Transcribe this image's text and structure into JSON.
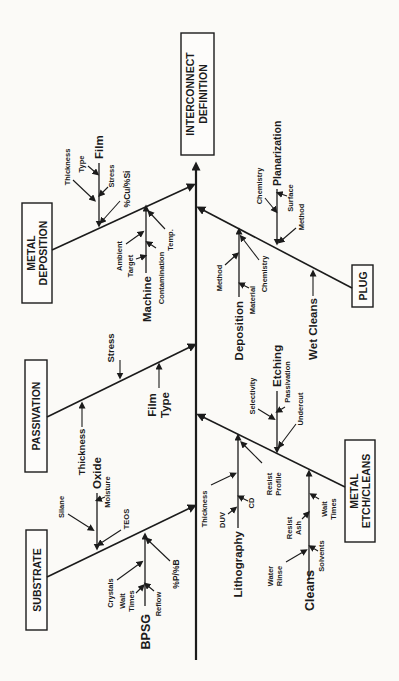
{
  "head": {
    "line1": "INTERCONNECT",
    "line2": "DEFINITION"
  },
  "bones": {
    "metal_deposition": {
      "box_line1": "METAL",
      "box_line2": "DEPOSITION",
      "film": "Film",
      "thickness": "Thickness",
      "type": "Type",
      "stress": "Stress",
      "cu_si": "%Cu/%Si",
      "machine": "Machine",
      "ambient": "Ambient",
      "target": "Target",
      "contamination": "Contamination",
      "temp": "Temp."
    },
    "passivation": {
      "box": "PASSIVATION",
      "thickness": "Thickness",
      "stress": "Stress",
      "film_type_line1": "Film",
      "film_type_line2": "Type"
    },
    "substrate": {
      "box": "SUBSTRATE",
      "oxide": "Oxide",
      "silane": "Silane",
      "moisture": "Moisture",
      "teos": "TEOS",
      "bpsg": "BPSG",
      "crystals": "Crystals",
      "wait": "Wait",
      "times": "Times",
      "reflow": "Reflow",
      "p_b": "%P/%B"
    },
    "plug": {
      "box": "PLUG",
      "planarization": "Planarization",
      "chemistry_planarization": "Chemistry",
      "surface": "Surface",
      "method_planarization": "Method",
      "deposition": "Deposition",
      "method_deposition": "Method",
      "material": "Material",
      "chemistry_deposition": "Chemistry",
      "wet_cleans": "Wet Cleans"
    },
    "metal_etch_cleans": {
      "box_line1": "METAL",
      "box_line2": "ETCH/CLEANS",
      "lithography": "Lithography",
      "thickness": "Thickness",
      "duv": "DUV",
      "cd": "CD",
      "resist": "Resist",
      "profile": "Profile",
      "cleans": "Cleans",
      "water": "Water",
      "rinse": "Rinse",
      "resist2": "Resist",
      "ash": "Ash",
      "solvents": "Solvents",
      "wait": "Wait",
      "times": "Times",
      "etching": "Etching",
      "selectivity": "Selectivity",
      "passivation": "Passivation",
      "undercut": "Undercut"
    }
  },
  "colors": {
    "ink": "#1b1b1b",
    "paper": "#fbfaf7"
  }
}
